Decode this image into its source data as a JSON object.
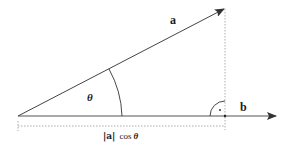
{
  "diagram": {
    "labels": {
      "vector_a": "a",
      "vector_b": "b",
      "angle": "θ",
      "projection_abs": "|a|",
      "projection_cos": "cos",
      "projection_theta": "θ"
    },
    "colors": {
      "line": "#444444",
      "dashed": "#888888",
      "text": "#1a1a1a"
    },
    "geometry": {
      "origin": [
        18,
        116
      ],
      "a_tip": [
        224,
        9
      ],
      "b_tip": [
        276,
        116
      ],
      "projection_foot": [
        225,
        116
      ]
    }
  }
}
